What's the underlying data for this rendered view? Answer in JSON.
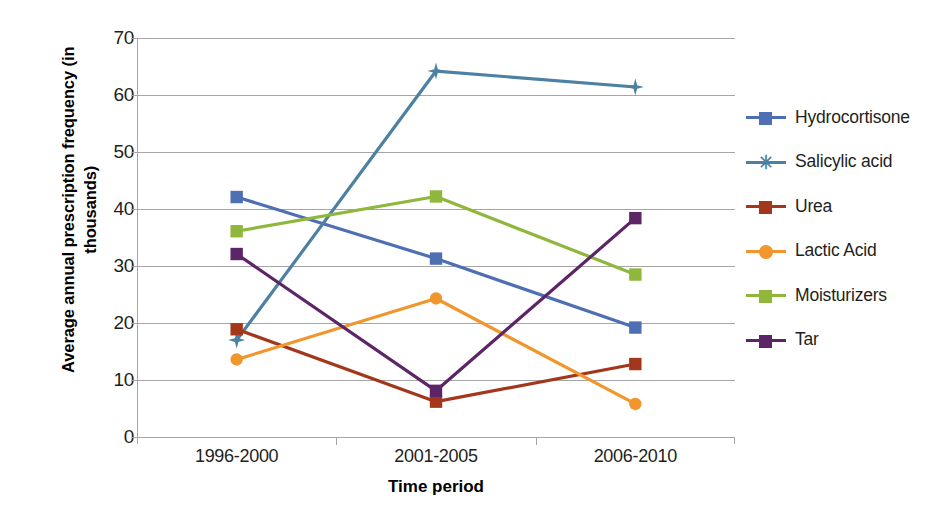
{
  "chart_data": {
    "type": "line",
    "title": "",
    "xlabel": "Time period",
    "ylabel": "Average annual prescription frequency (in thousands)",
    "ylabel_lines": [
      "Average annual prescription frequency (in",
      "thousands)"
    ],
    "categories": [
      "1996-2000",
      "2001-2005",
      "2006-2010"
    ],
    "yticks": [
      0,
      10,
      20,
      30,
      40,
      50,
      60,
      70
    ],
    "ylim": [
      0,
      70
    ],
    "grid": true,
    "legend_position": "right",
    "series": [
      {
        "name": "Hydrocortisone",
        "values": [
          42.1,
          31.3,
          19.2
        ],
        "color": "#4f6fb5",
        "marker": "square"
      },
      {
        "name": "Salicylic acid",
        "values": [
          17.0,
          64.2,
          61.4
        ],
        "color": "#4c81a3",
        "marker": "star"
      },
      {
        "name": "Urea",
        "values": [
          18.9,
          6.2,
          12.8
        ],
        "color": "#a3371b",
        "marker": "square"
      },
      {
        "name": "Lactic Acid",
        "values": [
          13.6,
          24.3,
          5.8
        ],
        "color": "#f0962d",
        "marker": "circle"
      },
      {
        "name": "Moisturizers",
        "values": [
          36.1,
          42.2,
          28.5
        ],
        "color": "#8fb73c",
        "marker": "square"
      },
      {
        "name": "Tar",
        "values": [
          32.1,
          8.1,
          38.4
        ],
        "color": "#5b2566",
        "marker": "square"
      }
    ]
  },
  "axis": {
    "y_title_line1": "Average annual prescription frequency (in",
    "y_title_line2": "thousands)",
    "x_title": "Time period",
    "y_tick_labels": [
      "70",
      "60",
      "50",
      "40",
      "30",
      "20",
      "10",
      "0"
    ],
    "x_tick_labels": [
      "1996-2000",
      "2001-2005",
      "2006-2010"
    ]
  },
  "legend": {
    "items": [
      {
        "label": "Hydrocortisone"
      },
      {
        "label": "Salicylic acid"
      },
      {
        "label": "Urea"
      },
      {
        "label": "Lactic Acid"
      },
      {
        "label": "Moisturizers"
      },
      {
        "label": "Tar"
      }
    ]
  },
  "colors": {
    "hydrocortisone": "#4f6fb5",
    "salicylic_acid": "#4c81a3",
    "urea": "#a3371b",
    "lactic_acid": "#f0962d",
    "moisturizers": "#8fb73c",
    "tar": "#5b2566",
    "gridline": "#a6a6a6",
    "text": "#231f20",
    "background": "#ffffff"
  }
}
